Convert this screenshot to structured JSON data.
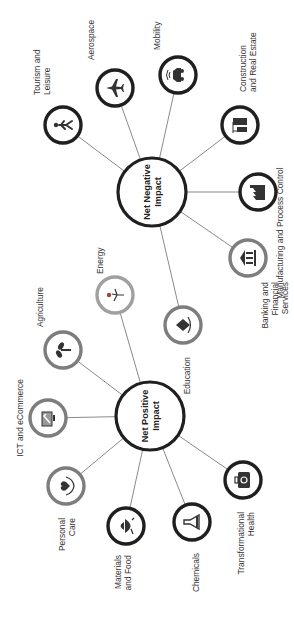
{
  "colors": {
    "dark_ring": "#1f1f1f",
    "grey_ring": "#7d7d7d",
    "light_ring": "#a0a0a0",
    "edge": "#8a8a8a",
    "icon": "#333333"
  },
  "hubs": {
    "negative": {
      "label_line1": "Net Negative",
      "label_line2": "Impact",
      "cx": 152,
      "cy": 192,
      "r": 34
    },
    "positive": {
      "label_line1": "Net Positive",
      "label_line2": "Impact",
      "cx": 150,
      "cy": 416,
      "r": 34
    }
  },
  "negative_nodes": [
    {
      "id": "tourism",
      "line1": "Tourism and",
      "line2": "Leisure",
      "icon": "walking-person-icon",
      "cx": 63,
      "cy": 125,
      "ring": "dark"
    },
    {
      "id": "aerospace",
      "line1": "Aerospace",
      "line2": "",
      "icon": "airplane-icon",
      "cx": 115,
      "cy": 88,
      "ring": "dark"
    },
    {
      "id": "mobility",
      "line1": "Mobility",
      "line2": "",
      "icon": "connected-car-icon",
      "cx": 178,
      "cy": 75,
      "ring": "dark"
    },
    {
      "id": "construction",
      "line1": "Construction",
      "line2": "and Real Estate",
      "icon": "buildings-crane-icon",
      "cx": 240,
      "cy": 125,
      "ring": "dark"
    },
    {
      "id": "manufacturing",
      "line1": "Manufacturing and Process Control",
      "line2": "",
      "icon": "factory-icon",
      "cx": 258,
      "cy": 192,
      "ring": "dark"
    },
    {
      "id": "banking",
      "line1": "Banking and",
      "line2": "Financial",
      "line3": "Services",
      "icon": "bank-icon",
      "cx": 248,
      "cy": 258,
      "ring": "grey"
    },
    {
      "id": "education",
      "line1": "Education",
      "line2": "",
      "icon": "book-hands-icon",
      "cx": 183,
      "cy": 325,
      "ring": "grey"
    }
  ],
  "positive_nodes": [
    {
      "id": "energy",
      "line1": "Energy",
      "line2": "",
      "icon": "wind-turbine-icon",
      "cx": 115,
      "cy": 295,
      "ring": "light"
    },
    {
      "id": "agriculture",
      "line1": "Agriculture",
      "line2": "",
      "icon": "sprout-icon",
      "cx": 63,
      "cy": 350,
      "ring": "grey"
    },
    {
      "id": "ict",
      "line1": "ICT and eCommerce",
      "line2": "",
      "icon": "computer-cart-icon",
      "cx": 48,
      "cy": 418,
      "ring": "grey"
    },
    {
      "id": "personal_care",
      "line1": "Personal",
      "line2": "Care",
      "icon": "heart-hands-icon",
      "cx": 66,
      "cy": 486,
      "ring": "grey"
    },
    {
      "id": "materials",
      "line1": "Materials",
      "line2": "and Food",
      "icon": "food-bowl-icon",
      "cx": 126,
      "cy": 526,
      "ring": "dark"
    },
    {
      "id": "chemicals",
      "line1": "Chemicals",
      "line2": "",
      "icon": "flask-icon",
      "cx": 192,
      "cy": 522,
      "ring": "dark"
    },
    {
      "id": "health",
      "line1": "Transformational",
      "line2": "Health",
      "icon": "medical-kit-icon",
      "cx": 243,
      "cy": 480,
      "ring": "dark"
    }
  ]
}
